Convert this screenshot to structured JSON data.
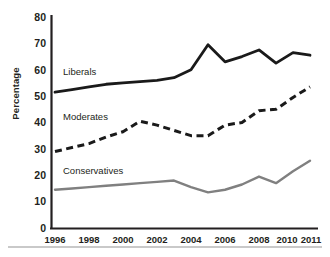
{
  "chart_data": {
    "type": "line",
    "title": "",
    "subtitle": "",
    "xlabel": "",
    "ylabel": "Percentage",
    "ylim": [
      0,
      80
    ],
    "xlim": [
      1996,
      2011
    ],
    "grid": false,
    "legend_position": "inline-on-plot",
    "y_ticks": [
      "0",
      "10",
      "20",
      "30",
      "40",
      "50",
      "60",
      "70",
      "80"
    ],
    "x_ticks": [
      "1996",
      "1998",
      "2000",
      "2002",
      "2004",
      "2006",
      "2008",
      "2010",
      "2011"
    ],
    "x": [
      1996,
      1997,
      1998,
      1999,
      2000,
      2001,
      2002,
      2003,
      2004,
      2005,
      2006,
      2007,
      2008,
      2009,
      2010,
      2011
    ],
    "series": [
      {
        "name": "Liberals",
        "style": "solid",
        "color": "#1a1a1a",
        "values": [
          51.5,
          52.5,
          53.5,
          54.5,
          55.0,
          55.5,
          56.0,
          57.0,
          60.0,
          69.5,
          63.0,
          65.0,
          67.5,
          62.5,
          66.5,
          65.5
        ]
      },
      {
        "name": "Moderates",
        "style": "dashed",
        "color": "#1a1a1a",
        "values": [
          29.0,
          30.5,
          32.0,
          34.5,
          36.5,
          40.5,
          39.0,
          37.0,
          35.0,
          35.0,
          39.0,
          40.0,
          44.5,
          45.0,
          49.5,
          53.5
        ]
      },
      {
        "name": "Conservatives",
        "style": "solid",
        "color": "#808080",
        "values": [
          14.5,
          15.0,
          15.5,
          16.0,
          16.5,
          17.0,
          17.5,
          18.0,
          15.5,
          13.5,
          14.5,
          16.5,
          19.5,
          17.0,
          21.5,
          25.5
        ]
      }
    ],
    "inline_labels": [
      {
        "text": "Liberals",
        "x_px": 63,
        "y_px": 67
      },
      {
        "text": "Moderates",
        "x_px": 63,
        "y_px": 112
      },
      {
        "text": "Conservatives",
        "x_px": 63,
        "y_px": 166
      }
    ]
  }
}
